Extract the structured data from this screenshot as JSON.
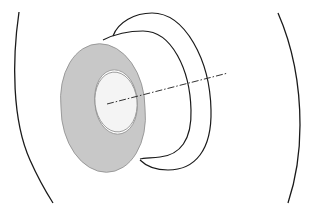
{
  "diagram": {
    "type": "3d-line-drawing",
    "colors": {
      "background": "#ffffff",
      "stroke": "#1a1a1a",
      "front_face_fill": "#c8c8c8",
      "hole_fill": "#f4f4f4",
      "axis_stroke": "#333333"
    },
    "elements": [
      {
        "id": "left-boundary-arc",
        "kind": "arc"
      },
      {
        "id": "right-boundary-arc",
        "kind": "arc"
      },
      {
        "id": "outer-back-rim",
        "kind": "ellipse"
      },
      {
        "id": "inner-back-rim",
        "kind": "ellipse"
      },
      {
        "id": "front-annulus-face",
        "kind": "shaded-ring"
      },
      {
        "id": "inner-hole",
        "kind": "ellipse"
      },
      {
        "id": "central-axis",
        "kind": "dash-dot-line"
      }
    ]
  }
}
